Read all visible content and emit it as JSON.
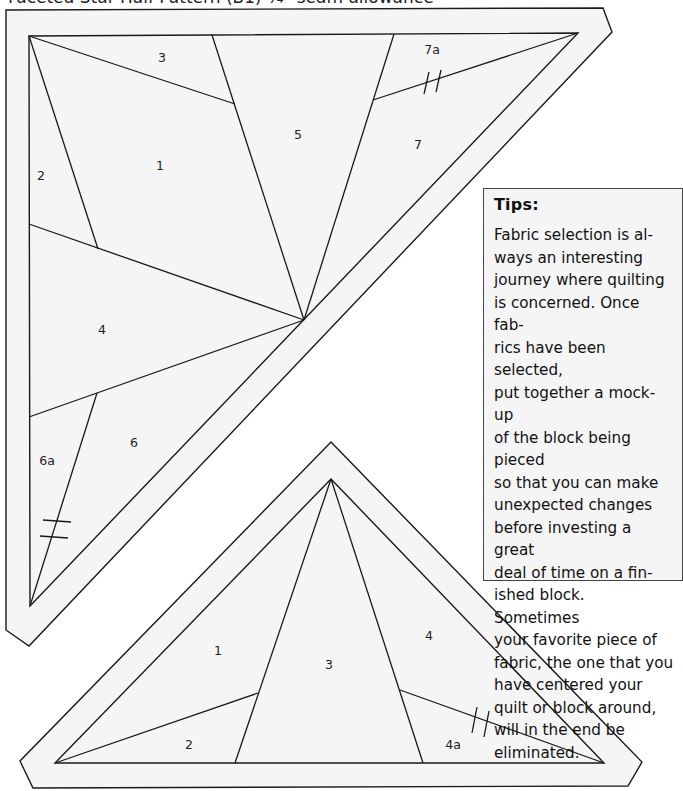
{
  "page": {
    "title": "Faceted Star Half Pattern (B1) ¼\" seam allowance"
  },
  "top_pattern": {
    "name": "Faceted Star Half Pattern (B1)",
    "pieces": [
      {
        "id": "1",
        "label": "1",
        "x": 160,
        "y": 170
      },
      {
        "id": "2",
        "label": "2",
        "x": 41,
        "y": 180
      },
      {
        "id": "3",
        "label": "3",
        "x": 162,
        "y": 60
      },
      {
        "id": "4",
        "label": "4",
        "x": 102,
        "y": 334
      },
      {
        "id": "5",
        "label": "5",
        "x": 298,
        "y": 138
      },
      {
        "id": "6",
        "label": "6",
        "x": 134,
        "y": 446
      },
      {
        "id": "6a",
        "label": "6a",
        "x": 47,
        "y": 462
      },
      {
        "id": "7",
        "label": "7",
        "x": 418,
        "y": 149
      },
      {
        "id": "7a",
        "label": "7a",
        "x": 432,
        "y": 52
      }
    ]
  },
  "bottom_pattern": {
    "name": "Faceted Star Half Pattern (B2)",
    "pieces": [
      {
        "id": "1",
        "label": "1",
        "x": 218,
        "y": 654
      },
      {
        "id": "2",
        "label": "2",
        "x": 189,
        "y": 748
      },
      {
        "id": "3",
        "label": "3",
        "x": 329,
        "y": 668
      },
      {
        "id": "4",
        "label": "4",
        "x": 429,
        "y": 639
      },
      {
        "id": "4a",
        "label": "4a",
        "x": 453,
        "y": 747
      }
    ]
  },
  "tips": {
    "title": "Tips:",
    "body": "Fabric selection is al-\nways an interesting\njourney where quilting\nis concerned. Once fab-\nrics have been selected,\nput together a mock-up\nof the block being pieced\nso that you can make\nunexpected changes\nbefore investing a great\ndeal of time on a fin-\nished block. Sometimes\nyour favorite piece of\nfabric, the one that you\nhave centered your\nquilt or block around,\nwill in the end be\neliminated."
  },
  "colors": {
    "line": "#1a1a1a",
    "fill": "#f5f5f5",
    "background": "#ffffff"
  }
}
